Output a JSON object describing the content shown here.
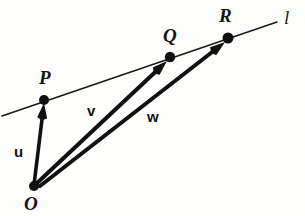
{
  "figure": {
    "width": 305,
    "height": 216,
    "background_color": "#fdfdfc",
    "ink_color": "#111111"
  },
  "points": [
    {
      "name": "origin",
      "label": "O",
      "x": 34,
      "y": 186,
      "label_x": 24,
      "label_y": 194,
      "dot_radius": 5.0,
      "on_line": false
    },
    {
      "name": "point-p",
      "label": "P",
      "x": 44,
      "y": 100,
      "label_x": 39,
      "label_y": 68,
      "dot_radius": 5.0,
      "on_line": true
    },
    {
      "name": "point-q",
      "label": "Q",
      "x": 170,
      "y": 57,
      "label_x": 163,
      "label_y": 26,
      "dot_radius": 5.2,
      "on_line": true
    },
    {
      "name": "point-r",
      "label": "R",
      "x": 228,
      "y": 38,
      "label_x": 219,
      "label_y": 6,
      "dot_radius": 5.5,
      "on_line": true
    }
  ],
  "line": {
    "name": "line-l",
    "label": "l",
    "label_x": 284,
    "label_y": 8,
    "x1": 2,
    "y1": 116,
    "x2": 277,
    "y2": 22,
    "stroke_width": 1.6,
    "color": "#1a1a1a"
  },
  "vectors": [
    {
      "name": "vector-u",
      "label": "u",
      "from": "O",
      "to": "P",
      "x1": 34,
      "y1": 185,
      "x2": 44,
      "y2": 103,
      "label_x": 14,
      "label_y": 144,
      "stroke_width": 3.6,
      "color": "#111111"
    },
    {
      "name": "vector-v",
      "label": "v",
      "from": "O",
      "to": "Q",
      "x1": 36,
      "y1": 184,
      "x2": 167,
      "y2": 61,
      "label_x": 87,
      "label_y": 103,
      "stroke_width": 4.0,
      "color": "#111111"
    },
    {
      "name": "vector-w",
      "label": "w",
      "from": "O",
      "to": "R",
      "x1": 40,
      "y1": 186,
      "x2": 225,
      "y2": 42,
      "label_x": 147,
      "label_y": 109,
      "stroke_width": 4.0,
      "color": "#111111"
    }
  ]
}
